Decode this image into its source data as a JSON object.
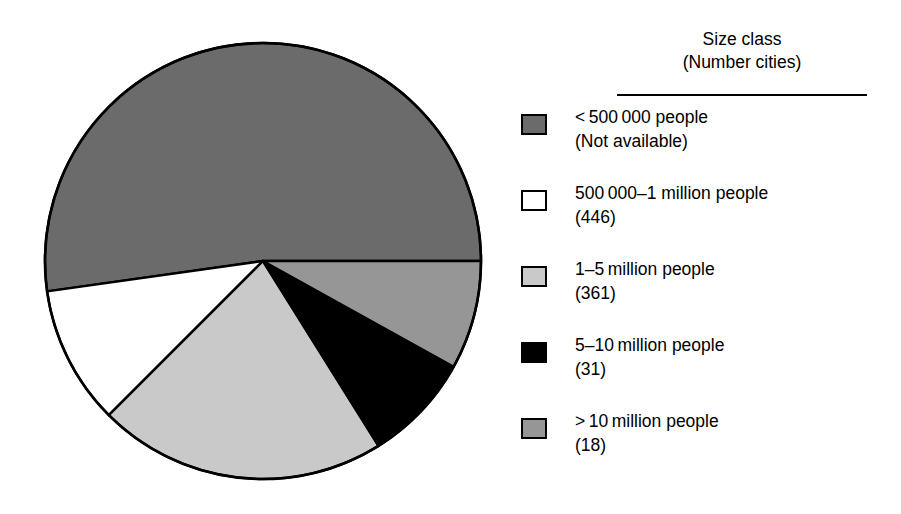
{
  "figure": {
    "background_color": "#ffffff",
    "type": "pie-chart-with-legend"
  },
  "legend": {
    "title_line1": "Size class",
    "title_line2": "(Number cities)",
    "rule_color": "#000000",
    "items": [
      {
        "label": "< 500 000 people",
        "count_label": "(Not available)",
        "color": "#6b6b6b",
        "swatch_name": "swatch-under-500000"
      },
      {
        "label": "500 000–1 million people",
        "count_label": "(446)",
        "color": "#ffffff",
        "swatch_name": "swatch-500000-1-million"
      },
      {
        "label": "1–5 million people",
        "count_label": "(361)",
        "color": "#c9c9c9",
        "swatch_name": "swatch-1-5-million"
      },
      {
        "label": "5–10 million people",
        "count_label": "(31)",
        "color": "#000000",
        "swatch_name": "swatch-5-10-million"
      },
      {
        "label": "> 10 million people",
        "count_label": "(18)",
        "color": "#969696",
        "swatch_name": "swatch-over-10-million"
      }
    ]
  },
  "chart_data": {
    "type": "pie",
    "title": "Size class (Number cities)",
    "xlabel": "",
    "ylabel": "",
    "legend_position": "right",
    "grid": false,
    "value_unit": "share of urban population",
    "center": {
      "x": 263,
      "y": 261
    },
    "radius": 218,
    "start_angle_deg": 0,
    "direction": "counterclockwise",
    "categories": [
      "< 500 000 people",
      "500 000–1 million people",
      "1–5 million people",
      "5–10 million people",
      "> 10 million people"
    ],
    "city_counts": [
      null,
      446,
      361,
      31,
      18
    ],
    "city_count_labels": [
      "(Not available)",
      "(446)",
      "(361)",
      "(31)",
      "(18)"
    ],
    "values": [
      52.2,
      10.3,
      21.4,
      8.1,
      8.0
    ],
    "angles_deg": [
      188,
      37,
      77,
      29,
      29
    ],
    "slice_boundaries_deg": [
      {
        "name": "< 500 000 people",
        "from": 0,
        "to": 188,
        "color": "#6b6b6b"
      },
      {
        "name": "500 000–1 million people",
        "from": 188,
        "to": 225,
        "color": "#ffffff"
      },
      {
        "name": "1–5 million people",
        "from": 225,
        "to": 302,
        "color": "#c9c9c9"
      },
      {
        "name": "5–10 million people",
        "from": 302,
        "to": 331,
        "color": "#000000"
      },
      {
        "name": "> 10 million people",
        "from": 331,
        "to": 360,
        "color": "#969696"
      }
    ],
    "colors": [
      "#6b6b6b",
      "#ffffff",
      "#c9c9c9",
      "#000000",
      "#969696"
    ],
    "outline_color": "#000000"
  }
}
